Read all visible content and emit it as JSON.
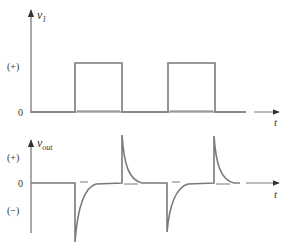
{
  "top_plot": {
    "y_axis_label": "v",
    "y_axis_subscript": "1",
    "x_axis_label": "t",
    "tick_labels": {
      "plus": "(+)",
      "zero": "0"
    }
  },
  "bottom_plot": {
    "y_axis_label": "v",
    "y_axis_subscript": "out",
    "x_axis_label": "t",
    "tick_labels": {
      "plus": "(+)",
      "zero": "0",
      "minus": "(−)"
    }
  },
  "colors": {
    "stroke": "#7a7a7a",
    "text": "#333333",
    "background": "#ffffff"
  }
}
